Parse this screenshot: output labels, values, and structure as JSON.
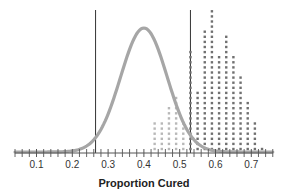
{
  "chart_data": {
    "type": "dotplot",
    "title": "",
    "xlabel": "Proportion Cured",
    "ylabel": "",
    "xlim": [
      0.04,
      0.76
    ],
    "x_ticks": [
      0.1,
      0.2,
      0.3,
      0.4,
      0.5,
      0.6,
      0.7
    ],
    "x_tick_labels": [
      "0.1",
      "0.2",
      "0.3",
      "0.4",
      "0.5",
      "0.6",
      "0.7"
    ],
    "minor_tick_step": 0.02,
    "grid": false,
    "legend": null,
    "series": [
      {
        "name": "simulated proportions (below cutoff)",
        "color": "#b8b8b8",
        "x": [
          0.43,
          0.45,
          0.47,
          0.49,
          0.51
        ],
        "counts": [
          6,
          6,
          9,
          11,
          6
        ]
      },
      {
        "name": "simulated proportions (at/above cutoff)",
        "color": "#707070",
        "x": [
          0.53,
          0.55,
          0.57,
          0.59,
          0.61,
          0.63,
          0.65,
          0.67,
          0.69,
          0.71,
          0.73
        ],
        "counts": [
          20,
          12,
          24,
          28,
          19,
          23,
          19,
          15,
          10,
          6,
          1
        ]
      }
    ],
    "curve": {
      "type": "normal",
      "mean": 0.4,
      "sd": 0.065,
      "color": "#a6a6a6"
    },
    "reference_lines": [
      {
        "x": 0.265,
        "color": "#333333"
      },
      {
        "x": 0.53,
        "color": "#333333"
      }
    ]
  }
}
